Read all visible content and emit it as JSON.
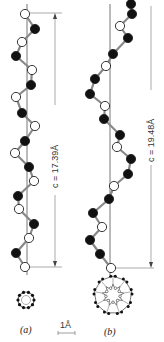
{
  "figure": {
    "panel_a": {
      "label": "(a)",
      "period_label": "c = 17.39Å",
      "period_value": 17.39,
      "unit": "Å"
    },
    "panel_b": {
      "label": "(b)",
      "period_label": "c = 19.48Å",
      "period_value": 19.48,
      "unit": "Å"
    },
    "scale_bar": {
      "label": "1Å"
    },
    "legend": {
      "filled_atom_color": "#111111",
      "open_atom_color": "#ffffff",
      "bond_color": "#888888"
    }
  },
  "helix_a": {
    "axis_x": 27,
    "atoms": [
      {
        "x": 25,
        "y": 14,
        "type": "open"
      },
      {
        "x": 35,
        "y": 29,
        "type": "filled"
      },
      {
        "x": 22,
        "y": 42,
        "type": "open"
      },
      {
        "x": 16,
        "y": 56,
        "type": "filled"
      },
      {
        "x": 32,
        "y": 70,
        "type": "open"
      },
      {
        "x": 31,
        "y": 85,
        "type": "filled"
      },
      {
        "x": 16,
        "y": 97,
        "type": "open"
      },
      {
        "x": 22,
        "y": 113,
        "type": "filled"
      },
      {
        "x": 35,
        "y": 126,
        "type": "open"
      },
      {
        "x": 25,
        "y": 141,
        "type": "filled"
      },
      {
        "x": 15,
        "y": 153,
        "type": "open"
      },
      {
        "x": 29,
        "y": 167,
        "type": "filled"
      },
      {
        "x": 34,
        "y": 181,
        "type": "open"
      },
      {
        "x": 18,
        "y": 196,
        "type": "filled"
      },
      {
        "x": 19,
        "y": 209,
        "type": "open"
      },
      {
        "x": 34,
        "y": 224,
        "type": "filled"
      },
      {
        "x": 29,
        "y": 238,
        "type": "open"
      },
      {
        "x": 16,
        "y": 253,
        "type": "filled"
      },
      {
        "x": 25,
        "y": 267,
        "type": "open"
      }
    ]
  },
  "helix_b": {
    "axis_x": 110,
    "atoms": [
      {
        "x": 131,
        "y": 4,
        "type": "filled"
      },
      {
        "x": 132,
        "y": 14,
        "type": "filled"
      },
      {
        "x": 120,
        "y": 26,
        "type": "open"
      },
      {
        "x": 128,
        "y": 38,
        "type": "filled"
      },
      {
        "x": 113,
        "y": 54,
        "type": "filled"
      },
      {
        "x": 106,
        "y": 66,
        "type": "open"
      },
      {
        "x": 95,
        "y": 79,
        "type": "filled"
      },
      {
        "x": 90,
        "y": 94,
        "type": "filled"
      },
      {
        "x": 105,
        "y": 106,
        "type": "open"
      },
      {
        "x": 104,
        "y": 119,
        "type": "filled"
      },
      {
        "x": 120,
        "y": 135,
        "type": "filled"
      },
      {
        "x": 117,
        "y": 147,
        "type": "open"
      },
      {
        "x": 131,
        "y": 159,
        "type": "filled"
      },
      {
        "x": 128,
        "y": 174,
        "type": "filled"
      },
      {
        "x": 114,
        "y": 186,
        "type": "open"
      },
      {
        "x": 109,
        "y": 199,
        "type": "filled"
      },
      {
        "x": 93,
        "y": 213,
        "type": "filled"
      },
      {
        "x": 102,
        "y": 227,
        "type": "open"
      },
      {
        "x": 90,
        "y": 240,
        "type": "filled"
      },
      {
        "x": 100,
        "y": 254,
        "type": "filled"
      },
      {
        "x": 111,
        "y": 268,
        "type": "open"
      }
    ]
  }
}
